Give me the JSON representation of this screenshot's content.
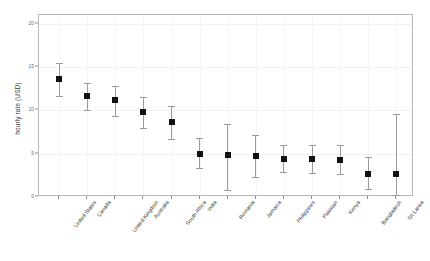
{
  "chart_data": {
    "type": "scatter",
    "title": "",
    "subtitle": "",
    "xlabel": "",
    "ylabel": "hourly rate (USD)",
    "ylim": [
      0,
      21
    ],
    "yticks": [
      0,
      5,
      10,
      15,
      20
    ],
    "ytick_labels": [
      "0",
      "5",
      "10",
      "15",
      "20"
    ],
    "grid": true,
    "legend": "none",
    "marker": "square",
    "marker_color": "#111111",
    "errorbar_color": "#9b9b9b",
    "categories": [
      "United States",
      "Canada",
      "United Kingdom",
      "Australia",
      "South Africa",
      "India",
      "Romania",
      "Jamaica",
      "Philippines",
      "Pakistan",
      "Kenya",
      "Bangladesh",
      "Sri Lanka"
    ],
    "series": [
      {
        "name": "hourly rate",
        "values": [
          13.6,
          11.7,
          11.2,
          9.8,
          8.7,
          5.0,
          4.8,
          4.7,
          4.4,
          4.4,
          4.3,
          2.7,
          2.7
        ],
        "err_low": [
          11.7,
          10.0,
          9.4,
          8.0,
          6.7,
          3.4,
          0.8,
          2.3,
          2.9,
          2.8,
          2.7,
          0.9,
          0.2
        ],
        "err_high": [
          15.5,
          13.2,
          12.8,
          11.5,
          10.5,
          6.8,
          8.4,
          7.2,
          6.0,
          6.0,
          6.0,
          4.6,
          9.6
        ]
      }
    ]
  }
}
